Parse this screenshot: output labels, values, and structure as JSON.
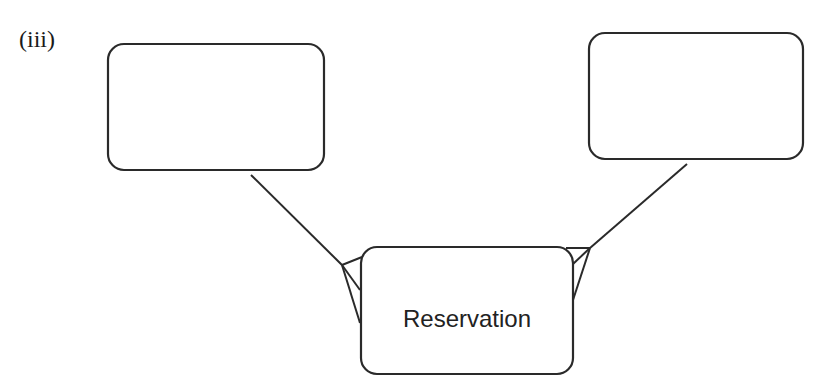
{
  "figure": {
    "label": "(iii)"
  },
  "entities": [
    {
      "id": "left-entity",
      "name": ""
    },
    {
      "id": "right-entity",
      "name": ""
    },
    {
      "id": "reservation-entity",
      "name": "Reservation"
    }
  ],
  "relationships": [
    {
      "from": "left-entity",
      "to": "reservation-entity",
      "from_cardinality": "one",
      "to_cardinality": "many"
    },
    {
      "from": "right-entity",
      "to": "reservation-entity",
      "from_cardinality": "one",
      "to_cardinality": "many"
    }
  ],
  "colors": {
    "stroke": "#2a2a2a",
    "background": "#ffffff",
    "text": "#222222"
  }
}
